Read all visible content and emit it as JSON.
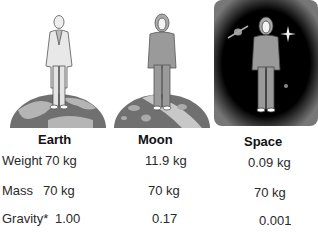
{
  "columns": [
    {
      "name": "Earth"
    },
    {
      "name": "Moon"
    },
    {
      "name": "Space"
    }
  ],
  "rows": [
    {
      "label": "Weight",
      "values": [
        "70 kg",
        "11.9 kg",
        "0.09 kg"
      ]
    },
    {
      "label": "Mass",
      "values": [
        "70 kg",
        "70 kg",
        "70 kg"
      ]
    },
    {
      "label": "Gravity*",
      "values": [
        "1.00",
        "0.17",
        "0.001"
      ]
    }
  ],
  "illustrations": [
    {
      "scene": "earth",
      "figure": "man-in-suit-on-earth"
    },
    {
      "scene": "moon",
      "figure": "astronaut-on-moon"
    },
    {
      "scene": "space",
      "figure": "astronaut-floating-in-space"
    }
  ],
  "colors": {
    "figure_fill": "#9a9a9a",
    "planet_dark": "#6e6e6e",
    "planet_light": "#b8b8b8",
    "space_bg": "#000000"
  }
}
